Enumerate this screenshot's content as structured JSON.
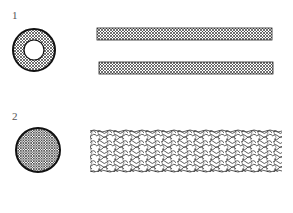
{
  "figures": [
    {
      "label": "1",
      "cross_section": "hollow-ring",
      "side_view": "two-parallel-hatched-bands",
      "colors": {
        "stroke": "#222222",
        "fill": "#ffffff"
      }
    },
    {
      "label": "2",
      "cross_section": "solid-hatched-disc",
      "side_view": "wavy-mesh-tube",
      "colors": {
        "stroke": "#222222",
        "fill": "#ffffff"
      }
    }
  ]
}
